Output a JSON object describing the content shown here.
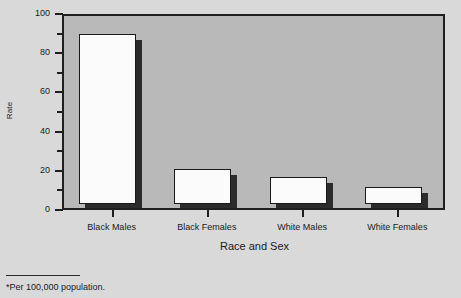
{
  "chart_data": {
    "type": "bar",
    "title": "",
    "subtitle": "",
    "categories": [
      "Black Males",
      "Black Females",
      "White Males",
      "White Females"
    ],
    "values": [
      86.5,
      18.0,
      13.8,
      8.5
    ],
    "xlabel": "Race and Sex",
    "ylabel": "Rate",
    "ylim": [
      0,
      100
    ],
    "ytick_labels": [
      "0",
      "20",
      "40",
      "60",
      "80",
      "100"
    ],
    "ytick_values": [
      0,
      20,
      40,
      60,
      80,
      100
    ],
    "yminor_values": [
      10,
      30,
      50,
      70,
      90
    ],
    "grid": false,
    "legend": "none",
    "bar_style": "white-face-with-dark-drop-shadow",
    "colors": {
      "bar_face": "#fbfbfb",
      "bar_edge": "#1a1a1a",
      "bar_shadow": "#2b2b2b",
      "plot_background": "#b9b9b9",
      "page_background": "#d9d9d9",
      "axis": "#1f1f1f",
      "text": "#1a1a1a"
    }
  },
  "footnote": {
    "text": "*Per 100,000 population."
  }
}
